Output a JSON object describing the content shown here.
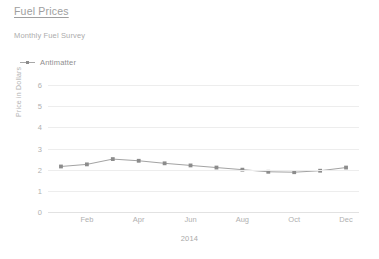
{
  "header": {
    "title": "Fuel Prices",
    "subtitle": "Monthly Fuel Survey"
  },
  "legend": {
    "position": "top-left",
    "items": [
      {
        "label": "Antimatter",
        "color": "#8c8c8c",
        "symbol": "line-marker-icon"
      }
    ]
  },
  "chart_data": {
    "type": "line",
    "title": "Fuel Prices",
    "subtitle": "Monthly Fuel Survey",
    "xlabel": "2014",
    "ylabel": "Price in Dollars",
    "categories": [
      "Jan",
      "Feb",
      "Mar",
      "Apr",
      "May",
      "Jun",
      "Jul",
      "Aug",
      "Sep",
      "Oct",
      "Nov",
      "Dec"
    ],
    "x_tick_labels": [
      "Feb",
      "Apr",
      "Jun",
      "Aug",
      "Oct",
      "Dec"
    ],
    "x_tick_categories": [
      "Feb",
      "Apr",
      "Jun",
      "Aug",
      "Oct",
      "Dec"
    ],
    "y_tick_labels": [
      "0",
      "1",
      "2",
      "3",
      "4",
      "5",
      "6"
    ],
    "yticks": [
      0,
      1,
      2,
      3,
      4,
      5,
      6
    ],
    "ylim": [
      0,
      6
    ],
    "grid": "horizontal",
    "legend_position": "top-left",
    "series": [
      {
        "name": "Antimatter",
        "color": "#8c8c8c",
        "marker": "square",
        "values": [
          2.15,
          2.25,
          2.5,
          2.42,
          2.3,
          2.2,
          2.1,
          2.0,
          1.9,
          1.88,
          1.95,
          2.1
        ]
      }
    ]
  },
  "series_display": {
    "antimatter_values_text": "2.15, 2.25, 2.50, 2.42, 2.30, 2.20, 2.10, 2.00, 1.90, 1.88, 1.95, 2.10"
  }
}
